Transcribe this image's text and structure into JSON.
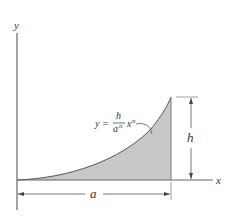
{
  "figure": {
    "axes": {
      "x_label": "x",
      "y_label": "y"
    },
    "curve": {
      "equation_lhs": "y =",
      "equation_numerator": "h",
      "equation_denominator_base": "a",
      "equation_denominator_exp": "n",
      "equation_var": "x",
      "equation_var_exp": "n",
      "fill_color": "#c8c8c8",
      "stroke_color": "#555555"
    },
    "dimensions": {
      "height_label": "h",
      "width_label": "a"
    }
  }
}
